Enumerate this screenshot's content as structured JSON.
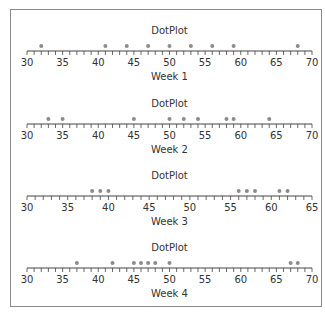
{
  "chart_data": [
    {
      "type": "scatter",
      "subtype": "dotplot",
      "title": "DotPlot",
      "xlabel": "Week 1",
      "xlim": [
        30,
        70
      ],
      "major_ticks": [
        30,
        35,
        40,
        45,
        50,
        55,
        60,
        65,
        70
      ],
      "minor_tick_step": 1,
      "values": [
        32,
        41,
        44,
        47,
        50,
        53,
        56,
        59,
        68
      ]
    },
    {
      "type": "scatter",
      "subtype": "dotplot",
      "title": "DotPlot",
      "xlabel": "Week 2",
      "xlim": [
        30,
        70
      ],
      "major_ticks": [
        30,
        35,
        40,
        45,
        50,
        55,
        60,
        65,
        70
      ],
      "minor_tick_step": 1,
      "values": [
        33,
        35,
        45,
        50,
        52,
        54,
        58,
        59,
        64
      ]
    },
    {
      "type": "scatter",
      "subtype": "dotplot",
      "title": "DotPlot",
      "xlabel": "Week 3",
      "xlim": [
        30,
        65
      ],
      "major_ticks": [
        30,
        35,
        40,
        45,
        50,
        55,
        60,
        65
      ],
      "minor_tick_step": 1,
      "values": [
        38,
        39,
        40,
        56,
        57,
        58,
        61,
        62
      ]
    },
    {
      "type": "scatter",
      "subtype": "dotplot",
      "title": "DotPlot",
      "xlabel": "Week 4",
      "xlim": [
        30,
        70
      ],
      "major_ticks": [
        30,
        35,
        40,
        45,
        50,
        55,
        60,
        65,
        70
      ],
      "minor_tick_step": 1,
      "values": [
        37,
        42,
        45,
        46,
        47,
        48,
        50,
        67,
        68
      ]
    }
  ],
  "colors": {
    "dot": "#8c8c8c",
    "axis": "#444444",
    "frame": "#8a8a8a",
    "text": "#333333"
  }
}
